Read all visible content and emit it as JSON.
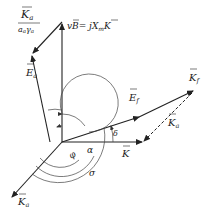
{
  "diagram": {
    "type": "phasor-diagram",
    "colors": {
      "stroke": "#222222",
      "background": "#ffffff"
    },
    "vectors": [
      {
        "id": "vB",
        "label": "vB = jX_m K",
        "label_main": "vB",
        "label_eq": "= j",
        "label_x": "X",
        "label_sub": "m",
        "label_k": "K"
      },
      {
        "id": "Ea",
        "label": "E_a",
        "label_main": "E",
        "label_sub": "a"
      },
      {
        "id": "Ka_over",
        "label": "K_a / (a_a γ_a)",
        "label_num": "K",
        "label_num_sub": "a",
        "label_den": "a",
        "label_den_sub1": "a",
        "label_den_g": "γ",
        "label_den_sub2": "a"
      },
      {
        "id": "Ef",
        "label": "E_f",
        "label_main": "E",
        "label_sub": "f"
      },
      {
        "id": "Kf",
        "label": "K_f",
        "label_main": "K",
        "label_sub": "f"
      },
      {
        "id": "K",
        "label": "K",
        "label_main": "K"
      },
      {
        "id": "Ka_dashed",
        "label": "K_a",
        "label_main": "K",
        "label_sub": "a"
      },
      {
        "id": "Ka_neg",
        "label": "K_a",
        "label_main": "K",
        "label_sub": "a"
      }
    ],
    "angles": [
      {
        "id": "delta",
        "label": "δ"
      },
      {
        "id": "alpha",
        "label": "α"
      },
      {
        "id": "phi",
        "label": "φ"
      },
      {
        "id": "sigma",
        "label": "σ"
      }
    ]
  }
}
